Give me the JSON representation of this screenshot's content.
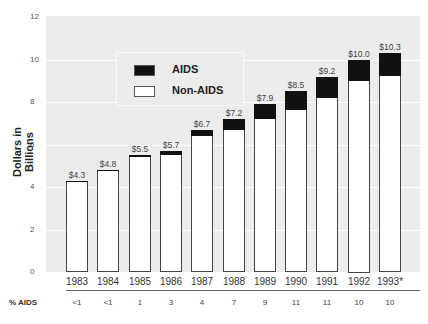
{
  "chart_data": {
    "type": "bar",
    "stacked": true,
    "title": "",
    "xlabel": "",
    "ylabel": "Dollars in Billions",
    "ylim": [
      0,
      12
    ],
    "yticks": [
      0,
      2,
      4,
      6,
      8,
      10,
      12
    ],
    "grid": true,
    "legend_position": "upper left (inside plot)",
    "categories": [
      "1983",
      "1984",
      "1985",
      "1986",
      "1987",
      "1988",
      "1989",
      "1990",
      "1991",
      "1992",
      "1993*"
    ],
    "totals": [
      4.3,
      4.8,
      5.5,
      5.7,
      6.7,
      7.2,
      7.9,
      8.5,
      9.2,
      10.0,
      10.3
    ],
    "total_labels": [
      "$4.3",
      "$4.8",
      "$5.5",
      "$5.7",
      "$6.7",
      "$7.2",
      "$7.9",
      "$8.5",
      "$9.2",
      "$10.0",
      "$10.3"
    ],
    "series": [
      {
        "name": "Non-AIDS",
        "color": "#ffffff",
        "values": [
          4.3,
          4.75,
          5.4,
          5.5,
          6.4,
          6.7,
          7.2,
          7.6,
          8.2,
          9.0,
          9.2
        ]
      },
      {
        "name": "AIDS",
        "color": "#111111",
        "values": [
          0.0,
          0.05,
          0.1,
          0.2,
          0.3,
          0.5,
          0.7,
          0.9,
          1.0,
          1.0,
          1.1
        ]
      }
    ],
    "pct_aids_label": "% AIDS",
    "pct_aids": [
      "<1",
      "<1",
      "1",
      "3",
      "4",
      "7",
      "9",
      "11",
      "11",
      "10",
      "10"
    ]
  },
  "legend": {
    "aids_label": "AIDS",
    "non_aids_label": "Non-AIDS"
  },
  "axis": {
    "ylabel": "Dollars in Billions",
    "yticks": [
      "0",
      "2",
      "4",
      "6",
      "8",
      "10",
      "12"
    ]
  }
}
